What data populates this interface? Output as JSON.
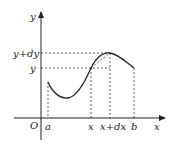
{
  "diagram": {
    "axes": {
      "x_label": "x",
      "y_label": "y",
      "origin_label": "O"
    },
    "x_ticks": [
      {
        "name": "a",
        "label": "a"
      },
      {
        "name": "x",
        "label": "x"
      },
      {
        "name": "x-plus-dx",
        "label": "x+dx"
      },
      {
        "name": "b",
        "label": "b"
      }
    ],
    "y_ticks": [
      {
        "name": "y-plus-dy",
        "label": "y+dy"
      },
      {
        "name": "y",
        "label": "y"
      }
    ],
    "colors": {
      "line": "#222222",
      "background": "#ffffff"
    }
  }
}
